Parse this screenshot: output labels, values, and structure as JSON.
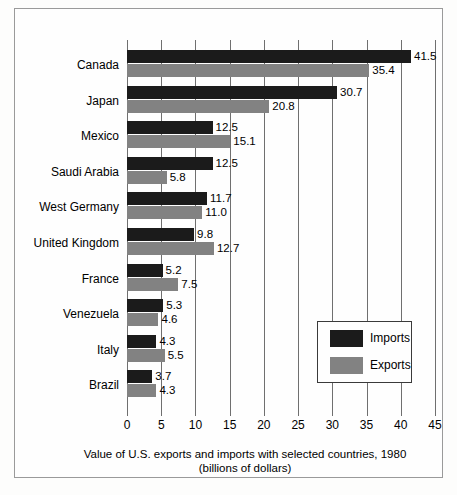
{
  "chart_data": {
    "type": "bar",
    "orientation": "horizontal",
    "title": "",
    "caption_line1": "Value of U.S. exports and imports with selected countries, 1980",
    "caption_line2": "(billions of dollars)",
    "xlabel": "",
    "ylabel": "",
    "xlim": [
      0,
      45
    ],
    "xticks": [
      0,
      5,
      10,
      15,
      20,
      25,
      30,
      35,
      40,
      45
    ],
    "xtick_labels": [
      "0",
      "5",
      "10",
      "15",
      "20",
      "25",
      "30",
      "35",
      "40",
      "45"
    ],
    "grid": true,
    "grid_axis": "x",
    "legend_position": "center-right",
    "categories": [
      "Canada",
      "Japan",
      "Mexico",
      "Saudi Arabia",
      "West Germany",
      "United Kingdom",
      "France",
      "Venezuela",
      "Italy",
      "Brazil"
    ],
    "series": [
      {
        "name": "Imports",
        "color": "#1b1b1b",
        "values": [
          41.5,
          30.7,
          12.5,
          12.5,
          11.7,
          9.8,
          5.2,
          5.3,
          4.3,
          3.7
        ],
        "labels": [
          "41.5",
          "30.7",
          "12.5",
          "12.5",
          "11.7",
          "9.8",
          "5.2",
          "5.3",
          "4.3",
          "3.7"
        ]
      },
      {
        "name": "Exports",
        "color": "#828282",
        "values": [
          35.4,
          20.8,
          15.1,
          5.8,
          11.0,
          12.7,
          7.5,
          4.6,
          5.5,
          4.3
        ],
        "labels": [
          "35.4",
          "20.8",
          "15.1",
          "5.8",
          "11.0",
          "12.7",
          "7.5",
          "4.6",
          "5.5",
          "4.3"
        ]
      }
    ]
  },
  "legend": {
    "entries": [
      {
        "label": "Imports",
        "color": "#1b1b1b"
      },
      {
        "label": "Exports",
        "color": "#828282"
      }
    ]
  }
}
